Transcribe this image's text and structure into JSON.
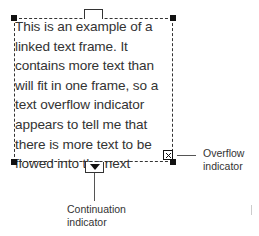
{
  "frame": {
    "text": "This is an example of a\nlinked text frame.  It\ncontains more text than\nwill fit in one frame, so a\ntext overflow indicator\nappears to tell me that\nthere is more text to be\nflowed into the next"
  },
  "callouts": {
    "overflow": {
      "line1": "Overflow",
      "line2": "indicator"
    },
    "continuation": {
      "line1": "Continuation",
      "line2": "indicator"
    }
  },
  "colors": {
    "frame_border": "#333333",
    "handle": "#111111",
    "text": "#333333"
  }
}
